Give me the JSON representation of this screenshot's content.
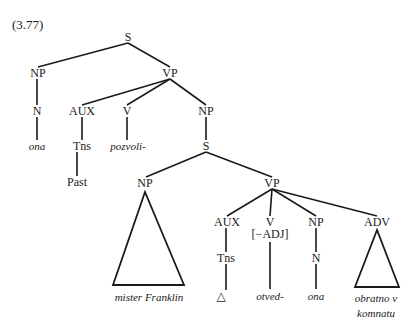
{
  "example_number": "(3.77)",
  "tree": {
    "nodes": [
      {
        "id": "S",
        "label": "S",
        "x": 128,
        "y": 37
      },
      {
        "id": "NP1",
        "label": "NP",
        "x": 38,
        "y": 73
      },
      {
        "id": "VP1",
        "label": "VP",
        "x": 170,
        "y": 73
      },
      {
        "id": "N1",
        "label": "N",
        "x": 37,
        "y": 111
      },
      {
        "id": "AUX1",
        "label": "AUX",
        "x": 82,
        "y": 111
      },
      {
        "id": "V1",
        "label": "V",
        "x": 127,
        "y": 111
      },
      {
        "id": "NP2",
        "label": "NP",
        "x": 206,
        "y": 111
      },
      {
        "id": "ona1",
        "label": "ona",
        "x": 37,
        "y": 146,
        "italic": true
      },
      {
        "id": "Tns1",
        "label": "Tns",
        "x": 82,
        "y": 146
      },
      {
        "id": "pozvoli",
        "label": "pozvoli-",
        "x": 128,
        "y": 146,
        "italic": true
      },
      {
        "id": "S2",
        "label": "S",
        "x": 206,
        "y": 146
      },
      {
        "id": "Past",
        "label": "Past",
        "x": 77,
        "y": 182
      },
      {
        "id": "NP3",
        "label": "NP",
        "x": 145,
        "y": 183
      },
      {
        "id": "VP2",
        "label": "VP",
        "x": 272,
        "y": 183
      },
      {
        "id": "AUX2",
        "label": "AUX",
        "x": 227,
        "y": 222
      },
      {
        "id": "V2",
        "label": "V",
        "x": 270,
        "y": 222
      },
      {
        "id": "V2feat",
        "label": "[−ADJ]",
        "x": 270,
        "y": 234
      },
      {
        "id": "NP4",
        "label": "NP",
        "x": 316,
        "y": 222
      },
      {
        "id": "ADV",
        "label": "ADV",
        "x": 377,
        "y": 222
      },
      {
        "id": "Tns2",
        "label": "Tns",
        "x": 226,
        "y": 258
      },
      {
        "id": "N2",
        "label": "N",
        "x": 316,
        "y": 258
      },
      {
        "id": "misterFranklin",
        "label": "mister Franklin",
        "x": 149,
        "y": 297,
        "italic": true
      },
      {
        "id": "delta",
        "label": "△",
        "x": 221,
        "y": 296
      },
      {
        "id": "otved",
        "label": "otved-",
        "x": 270,
        "y": 296,
        "italic": true
      },
      {
        "id": "ona2",
        "label": "ona",
        "x": 316,
        "y": 296,
        "italic": true
      },
      {
        "id": "obratno",
        "label": "obratno v",
        "x": 376,
        "y": 298,
        "italic": true
      },
      {
        "id": "komnatu",
        "label": "komnatu",
        "x": 376,
        "y": 313,
        "italic": true
      }
    ],
    "edges": [
      [
        128,
        43,
        38,
        67
      ],
      [
        128,
        43,
        170,
        67
      ],
      [
        37,
        79,
        37,
        105
      ],
      [
        170,
        79,
        82,
        105
      ],
      [
        170,
        79,
        127,
        105
      ],
      [
        170,
        79,
        206,
        105
      ],
      [
        37,
        117,
        37,
        140
      ],
      [
        82,
        117,
        82,
        140
      ],
      [
        127,
        117,
        127,
        140
      ],
      [
        206,
        117,
        206,
        140
      ],
      [
        77,
        152,
        77,
        176
      ],
      [
        206,
        152,
        146,
        177
      ],
      [
        206,
        152,
        272,
        177
      ],
      [
        272,
        189,
        227,
        216
      ],
      [
        272,
        189,
        270,
        216
      ],
      [
        272,
        189,
        316,
        216
      ],
      [
        272,
        189,
        377,
        216
      ],
      [
        226,
        228,
        226,
        252
      ],
      [
        270,
        242,
        270,
        289
      ],
      [
        316,
        228,
        316,
        252
      ],
      [
        316,
        264,
        316,
        289
      ],
      [
        226,
        264,
        226,
        290
      ]
    ],
    "triangles": [
      {
        "name": "np-mister-franklin-triangle",
        "points": "145,192 113,285 184,285"
      },
      {
        "name": "adv-obratno-triangle",
        "points": "377,230 355,287 399,287"
      }
    ]
  }
}
